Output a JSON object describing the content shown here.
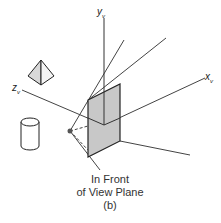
{
  "diagram": {
    "axes": {
      "y": {
        "label": "y",
        "subscript": "v"
      },
      "x": {
        "label": "x",
        "subscript": "v"
      },
      "z": {
        "label": "z",
        "subscript": "v"
      }
    },
    "objects": [
      "pyramid",
      "cylinder",
      "view-plane",
      "projection-reference-point"
    ],
    "caption": {
      "line1": "In Front",
      "line2": "of View Plane",
      "line3": "(b)"
    },
    "colors": {
      "plane_fill": "#c8c8c8",
      "line": "#333333",
      "pyramid_fill": "#d0d0d0"
    }
  }
}
